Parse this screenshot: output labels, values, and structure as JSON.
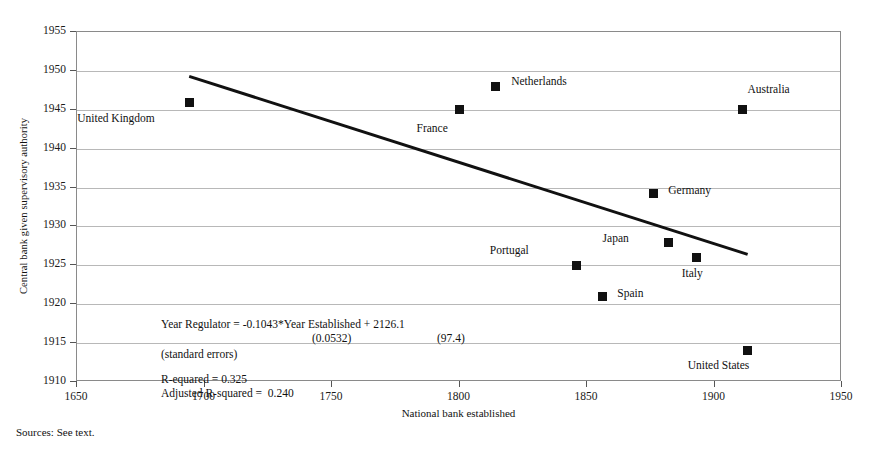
{
  "chart_data": {
    "type": "scatter",
    "title": "",
    "xlabel": "National bank established",
    "ylabel": "Central bank given supervisory authority",
    "xlim": [
      1650,
      1950
    ],
    "ylim": [
      1910,
      1955
    ],
    "xticks": [
      1650,
      1700,
      1750,
      1800,
      1850,
      1900,
      1950
    ],
    "yticks": [
      1910,
      1915,
      1920,
      1925,
      1930,
      1935,
      1940,
      1945,
      1950,
      1955
    ],
    "grid": "horizontal",
    "legend": "none",
    "points": [
      {
        "label": "United Kingdom",
        "x": 1694,
        "y": 1946,
        "label_dx": -44,
        "label_dy": 16
      },
      {
        "label": "France",
        "x": 1800,
        "y": 1945,
        "label_dx": -22,
        "label_dy": 18
      },
      {
        "label": "Netherlands",
        "x": 1814,
        "y": 1948,
        "label_dx": 16,
        "label_dy": -5
      },
      {
        "label": "Australia",
        "x": 1911,
        "y": 1945,
        "label_dx": 5,
        "label_dy": -21
      },
      {
        "label": "Germany",
        "x": 1876,
        "y": 1934.3,
        "label_dx": 15,
        "label_dy": -3
      },
      {
        "label": "Japan",
        "x": 1882,
        "y": 1928,
        "label_dx": -50,
        "label_dy": -4
      },
      {
        "label": "Italy",
        "x": 1893,
        "y": 1926,
        "label_dx": -4,
        "label_dy": 15
      },
      {
        "label": "Portugal",
        "x": 1846,
        "y": 1925,
        "label_dx": -58,
        "label_dy": -15
      },
      {
        "label": "Spain",
        "x": 1856,
        "y": 1921,
        "label_dx": 15,
        "label_dy": -3
      },
      {
        "label": "United States",
        "x": 1913,
        "y": 1914,
        "label_dx": -8,
        "label_dy": 14
      }
    ],
    "trendline": {
      "slope": -0.1043,
      "intercept": 2126.1,
      "x_start": 1694,
      "x_end": 1913,
      "y_start": 1949.3,
      "y_end": 1926.4
    },
    "annotations": {
      "equation": "Year Regulator = -0.1043*Year Established + 2126.1",
      "se_slope": "(0.0532)",
      "se_intercept": "(97.4)",
      "se_caption": "(standard errors)",
      "r_squared": "R-equared = 0.325",
      "adj_r_squared": "Adjusted R-squared =  0.240"
    }
  },
  "footer": {
    "source_note": "Sources: See text."
  },
  "colors": {
    "marker": "#111111",
    "trendline": "#111111",
    "gridline": "#b8b8b8",
    "frame": "#8a8a8a",
    "text": "#111111"
  }
}
